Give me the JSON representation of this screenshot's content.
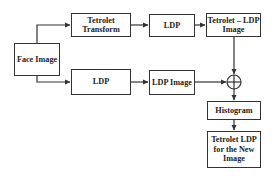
{
  "diagram": {
    "nodes": [
      {
        "id": "face_image",
        "label": "Face Image"
      },
      {
        "id": "tetrolet_transform",
        "label": "Tetrolet Transform"
      },
      {
        "id": "ldp_top",
        "label": "LDP"
      },
      {
        "id": "tetrolet_ldp_image",
        "label": "Tetrolet – LDP Image"
      },
      {
        "id": "ldp_bottom",
        "label": "LDP"
      },
      {
        "id": "ldp_image",
        "label": "LDP Image"
      },
      {
        "id": "combine",
        "label": "⊕"
      },
      {
        "id": "histogram",
        "label": "Histogram"
      },
      {
        "id": "tetrolet_ldp_new",
        "label": "Tetrolet LDP for the New Image"
      }
    ],
    "edges": [
      {
        "from": "face_image",
        "to": "tetrolet_transform"
      },
      {
        "from": "face_image",
        "to": "ldp_bottom"
      },
      {
        "from": "tetrolet_transform",
        "to": "ldp_top"
      },
      {
        "from": "ldp_top",
        "to": "tetrolet_ldp_image"
      },
      {
        "from": "ldp_bottom",
        "to": "ldp_image"
      },
      {
        "from": "tetrolet_ldp_image",
        "to": "combine"
      },
      {
        "from": "ldp_image",
        "to": "combine"
      },
      {
        "from": "combine",
        "to": "histogram"
      },
      {
        "from": "histogram",
        "to": "tetrolet_ldp_new"
      }
    ],
    "colors": {
      "stroke": "#333333",
      "text": "#222222",
      "background": "#ffffff"
    }
  },
  "labels": {
    "face_image": "Face Image",
    "tetrolet_transform": "Tetrolet Transform",
    "ldp_top": "LDP",
    "tetrolet_ldp_image": "Tetrolet – LDP Image",
    "ldp_bottom": "LDP",
    "ldp_image": "LDP Image",
    "histogram": "Histogram",
    "tetrolet_ldp_new": "Tetrolet LDP for the New Image"
  }
}
